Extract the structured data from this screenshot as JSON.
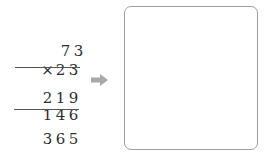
{
  "problem": {
    "multiplicand": [
      "7",
      "3"
    ],
    "operator": "×",
    "multiplier": [
      "2",
      "3"
    ],
    "partial_product_1": [
      "2",
      "1",
      "9"
    ],
    "partial_product_2": [
      "1",
      "4",
      "6"
    ],
    "result": [
      "3",
      "6",
      "5"
    ]
  },
  "arrow": {
    "icon": "arrow-right-icon",
    "color": "#a8a8a8"
  },
  "answer_box": {
    "border_color": "#9e9e9e",
    "content": ""
  }
}
